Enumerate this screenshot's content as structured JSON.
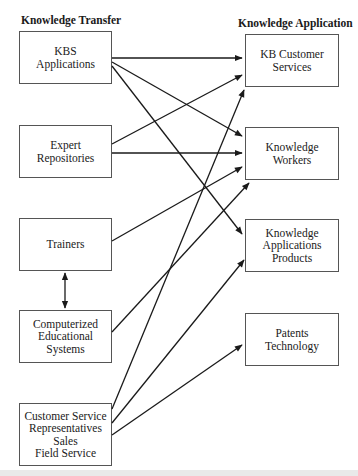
{
  "headers": {
    "left": "Knowledge Transfer",
    "right": "Knowledge Application"
  },
  "left_boxes": [
    {
      "id": "kbs",
      "label": "KBS\nApplications"
    },
    {
      "id": "expert",
      "label": "Expert\nRepositories"
    },
    {
      "id": "trainers",
      "label": "Trainers"
    },
    {
      "id": "ces",
      "label": "Computerized\nEducational\nSystems"
    },
    {
      "id": "csr",
      "label": "Customer Service\nRepresentatives\nSales\nField Service"
    }
  ],
  "right_boxes": [
    {
      "id": "kbcs",
      "label": "KB Customer\nServices"
    },
    {
      "id": "kw",
      "label": "Knowledge\nWorkers"
    },
    {
      "id": "kap",
      "label": "Knowledge\nApplications\nProducts"
    },
    {
      "id": "pt",
      "label": "Patents\nTechnology"
    }
  ],
  "connections": [
    {
      "from": "kbs",
      "to": "kbcs"
    },
    {
      "from": "kbs",
      "to": "kw"
    },
    {
      "from": "kbs",
      "to": "kap"
    },
    {
      "from": "expert",
      "to": "kbcs"
    },
    {
      "from": "expert",
      "to": "kw"
    },
    {
      "from": "trainers",
      "to": "kw"
    },
    {
      "from": "trainers",
      "to": "ces",
      "bidirectional": true
    },
    {
      "from": "ces",
      "to": "kw"
    },
    {
      "from": "csr",
      "to": "kbcs"
    },
    {
      "from": "csr",
      "to": "kap"
    },
    {
      "from": "csr",
      "to": "pt"
    }
  ],
  "colors": {
    "line": "#1a1a1a",
    "box_border": "#555555"
  }
}
